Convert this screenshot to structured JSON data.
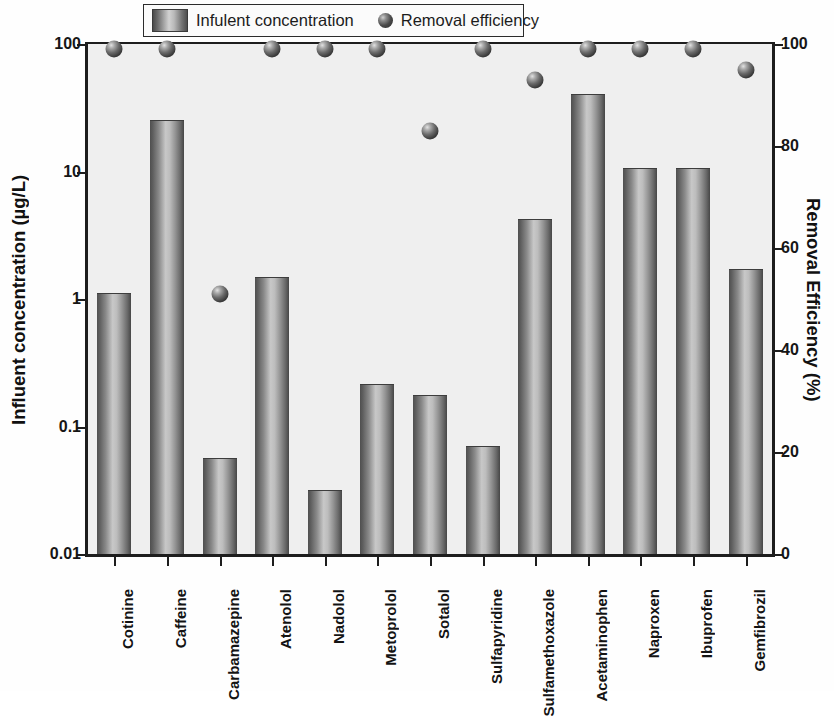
{
  "legend": {
    "items": [
      {
        "label": "Infulent concentration",
        "marker": "bar-swatch-icon"
      },
      {
        "label": "Removal efficiency",
        "marker": "sphere-dot-icon"
      }
    ]
  },
  "axes": {
    "left_title": "Influent concentration (µg/L)",
    "right_title": "Removal Efficiency (%)",
    "left_ticks": [
      "0.01",
      "0.1",
      "1",
      "10",
      "100"
    ],
    "right_ticks": [
      "0",
      "20",
      "40",
      "60",
      "80",
      "100"
    ]
  },
  "chart_data": {
    "type": "bar",
    "title": "",
    "xlabel": "",
    "ylabel": "Influent concentration (µg/L)",
    "y2label": "Removal Efficiency (%)",
    "yscale": "log",
    "ylim": [
      0.01,
      100
    ],
    "y2lim": [
      0,
      100
    ],
    "grid": false,
    "legend_position": "top-center",
    "categories": [
      "Cotinine",
      "Caffeine",
      "Carbamazepine",
      "Atenolol",
      "Nadolol",
      "Metoprolol",
      "Sotalol",
      "Sulfapyridine",
      "Sulfamethoxazole",
      "Acetaminophen",
      "Naproxen",
      "Ibuprofen",
      "Gemfibrozil"
    ],
    "series": [
      {
        "name": "Infulent concentration",
        "axis": "left",
        "unit": "µg/L",
        "type": "bar",
        "values": [
          1.1,
          25.0,
          0.056,
          1.45,
          0.031,
          0.21,
          0.175,
          0.069,
          4.2,
          40.0,
          10.5,
          10.4,
          1.7
        ]
      },
      {
        "name": "Removal efficiency",
        "axis": "right",
        "unit": "%",
        "type": "scatter",
        "values": [
          99,
          99,
          51,
          99,
          99,
          99,
          83,
          99,
          93,
          99,
          99,
          99,
          95
        ]
      }
    ]
  }
}
